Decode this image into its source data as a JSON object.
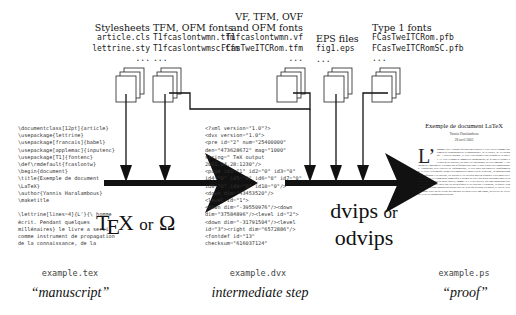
{
  "inputs": {
    "stylesheets": {
      "title": "Stylesheets",
      "files": [
        "article.cls",
        "lettrine.sty",
        "..."
      ]
    },
    "tfm_ofm": {
      "title": "TFM, OFM fonts",
      "files": [
        "T1fcaslontwmn.tfm",
        "T1fcaslontwmsc.tfm",
        "..."
      ]
    },
    "vf_tfm": {
      "title_line1": "VF, TFM, OVF",
      "title_line2": "and OFM fonts",
      "files": [
        "T1fcaslontwmn.vf",
        "FCasTweITCRom.tfm",
        "..."
      ]
    },
    "eps": {
      "title": "EPS files",
      "files": [
        "fig1.eps",
        "..."
      ]
    },
    "type1": {
      "title": "Type 1 fonts",
      "files": [
        "FCasTweITCRom.pfb",
        "FCasTweITCRomSC.pfb",
        "..."
      ]
    }
  },
  "stages": {
    "manuscript": {
      "code": "\\documentclass[12pt]{article}\n\\usepackage{lettrine}\n\\usepackage[francais]{babel}\n\\usepackage[applemac]{inputenc}\n\\usepackage[T1]{fontenc}\n\\def\\rmdefault{fcaslontw}\n\\begin{document}\n\\title{Exemple de document\n\\LaTeX}\n\\author{Yannis Haralambous}\n\\maketitle\n\n\\lettrine[lines=4]{L'}{\\ homme\nécrit. Pendant quelques\nmillénaires} le livre a servi\ncomme instrument de propagation\nde la connaissance, de la",
      "filename": "example.tex",
      "caption": "“manuscript”"
    },
    "intermediate": {
      "code": "<?xml version=\"1.0\"?>\n<dvx version=\"1.0\">\n<pre id=\"2\" num=\"25400000\"\nden=\"473628672\" mag=\"1000\"\nstring=\" TeX output\n2001.04.28:1230\"/>\n<page id1=\"1\" id2=\"0\" id3=\"0\"\nid4=\"0\" id5=\"0\" id6=\"0\" id7=\"0\"\nid8=\"0\" id9=\"0\" id10=\"0\"/>\n<down dim=\"43453520\"/>\n<level id=\"1\">\n<down dim=\"-39550976\"/><down\ndim=\"37584896\"/><level id=\"2\">\n<down dim=\"-31791504\"/><level\nid=\"3\"><right dim=\"6572886\"/>\n<fontdef id=\"13\"\nchecksum=\"616037124\"",
      "filename": "example.dvx",
      "caption": "intermediate step"
    },
    "proof": {
      "doc_title": "Exemple de document LaTeX",
      "doc_author": "Yannis Haralambous",
      "doc_date": "28 avril 2003",
      "dropcap": "L’",
      "body": "homme écrit. Pendant quelques millénaires le livre a servi comme instrument de propagation de la connaissance, de la culture, de la l'idéologie. A travers l'histoire, le livre a su s'adapter aux besoins de la société. Le livre a connu de nombreux changements, de la tablette d'argile au rouleau de papyrus, au codex de parchemin, au livre imprimé. L'invention de l'imprimerie a permis une diffusion plus large et plus rapide des connaissances. Aujourd'hui, avec l'arrivée de l'informatique, le livre subit une nouvelle transformation. Le texte électronique permet des possibilités nouvelles de recherche, de manipulation et de diffusion. Les éditeurs, les auteurs et les lecteurs doivent s'adapter à ces nouvelles technologies. La typographie numérique a permis de créer des outils puissants pour la composition de textes de haute qualité, comme TeX et ses dérivés, qui sont aujourd'hui utilisés dans le monde entier par les scientifiques et les éditeurs. Cependant, la qualité typographique dépend toujours du savoir-faire de ceux qui utilisent ces outils, et l'art de la typographie reste un art vivant qui continue d'évoluer avec son temps, au service de la lecture et de la transmission du savoir.",
      "filename": "example.ps",
      "caption": "“proof”"
    }
  },
  "processors": {
    "tex": {
      "t": "T",
      "e": "E",
      "x": "X",
      "or": "or",
      "omega": "Ω"
    },
    "dvips": {
      "line1_main": "dvips",
      "line1_or": "or",
      "line2": "odvips"
    }
  }
}
